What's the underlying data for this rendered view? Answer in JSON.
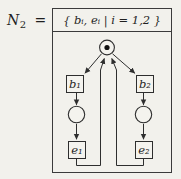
{
  "figure": {
    "colors": {
      "paper": "#f2f1ec",
      "ink": "#2e2e2e",
      "box_border": "#3b3b3b",
      "token": "#111111"
    }
  },
  "equation": {
    "symbol": "N",
    "subscript": "2",
    "operator": "="
  },
  "header": {
    "text": "{ bᵢ, eᵢ  |  i = 1,2 }"
  },
  "nodes": {
    "b1": {
      "label": "b₁"
    },
    "b2": {
      "label": "b₂"
    },
    "e1": {
      "label": "e₁"
    },
    "e2": {
      "label": "e₂"
    },
    "marked_place": {
      "type": "place-with-token"
    },
    "place_left": {
      "type": "place"
    },
    "place_right": {
      "type": "place"
    }
  },
  "edges": [
    {
      "from": "marked_place",
      "to": "b1"
    },
    {
      "from": "marked_place",
      "to": "b2"
    },
    {
      "from": "b1",
      "to": "place_left"
    },
    {
      "from": "place_left",
      "to": "e1"
    },
    {
      "from": "b2",
      "to": "place_right"
    },
    {
      "from": "place_right",
      "to": "e2"
    },
    {
      "from": "e1",
      "to": "marked_place"
    },
    {
      "from": "e2",
      "to": "marked_place"
    }
  ]
}
